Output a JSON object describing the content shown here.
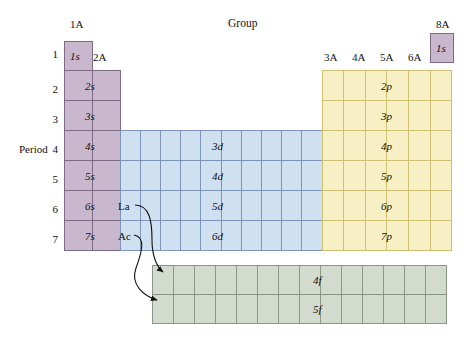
{
  "figure": {
    "title_group": "Group",
    "title_period": "Period"
  },
  "group_labels": {
    "g1a": "1A",
    "g2a": "2A",
    "g3a": "3A",
    "g4a": "4A",
    "g5a": "5A",
    "g6a": "6A",
    "g7a": "7A",
    "g8a": "8A"
  },
  "period_labels": [
    "1",
    "2",
    "3",
    "4",
    "5",
    "6",
    "7"
  ],
  "blocks": {
    "s": {
      "name": "s-block",
      "color": "#c9b7ce",
      "border": "#7d6a84",
      "columns": 2,
      "rows": 7,
      "orbitals": [
        "1s",
        "2s",
        "3s",
        "4s",
        "5s",
        "6s",
        "7s"
      ]
    },
    "d": {
      "name": "d-block",
      "color": "#cfe0f1",
      "border": "#7d93b8",
      "columns": 10,
      "rows": 4,
      "orbitals": [
        "3d",
        "4d",
        "5d",
        "6d"
      ]
    },
    "p": {
      "name": "p-block",
      "color": "#f7f0c4",
      "border": "#cfbf72",
      "columns": 6,
      "rows": 6,
      "orbitals": [
        "2p",
        "3p",
        "4p",
        "5p",
        "6p",
        "7p"
      ]
    },
    "f": {
      "name": "f-block",
      "color": "#d3dbce",
      "border": "#8b968a",
      "columns": 14,
      "rows": 2,
      "orbitals": [
        "4f",
        "5f"
      ]
    },
    "helium": {
      "name": "helium-cell",
      "orbital": "1s"
    }
  },
  "annotations": {
    "la": "La",
    "ac": "Ac"
  },
  "orbital_text": {
    "o1s": "1s",
    "o2s": "2s",
    "o3s": "3s",
    "o4s": "4s",
    "o5s": "5s",
    "o6s": "6s",
    "o7s": "7s",
    "o3d": "3d",
    "o4d": "4d",
    "o5d": "5d",
    "o6d": "6d",
    "o2p": "2p",
    "o3p": "3p",
    "o4p": "4p",
    "o5p": "5p",
    "o6p": "6p",
    "o7p": "7p",
    "o4f": "4f",
    "o5f": "5f",
    "he1s": "1s"
  }
}
